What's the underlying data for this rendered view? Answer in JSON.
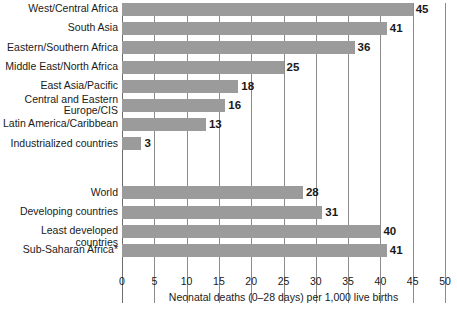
{
  "chart_data": {
    "type": "bar",
    "orientation": "horizontal",
    "title": "",
    "xlabel": "Neonatal deaths (0–28 days) per 1,000 live births",
    "ylabel": "",
    "xlim": [
      0,
      50
    ],
    "xticks": [
      "0",
      "5",
      "10",
      "15",
      "20",
      "25",
      "30",
      "35",
      "40",
      "45",
      "50"
    ],
    "grid": true,
    "legend": "none",
    "bar_color": "#9b9b9b",
    "groups": [
      {
        "name": "regions",
        "categories": [
          "West/Central Africa",
          "South Asia",
          "Eastern/Southern Africa",
          "Middle East/North Africa",
          "East Asia/Pacific",
          "Central and Eastern\nEurope/CIS",
          "Latin America/Caribbean",
          "Industrialized countries"
        ],
        "values": [
          45,
          41,
          36,
          25,
          18,
          16,
          13,
          3
        ]
      },
      {
        "name": "aggregates",
        "categories": [
          "World",
          "Developing countries",
          "Least developed countries",
          "Sub-Saharan Africa*"
        ],
        "values": [
          28,
          31,
          40,
          41
        ]
      }
    ]
  }
}
